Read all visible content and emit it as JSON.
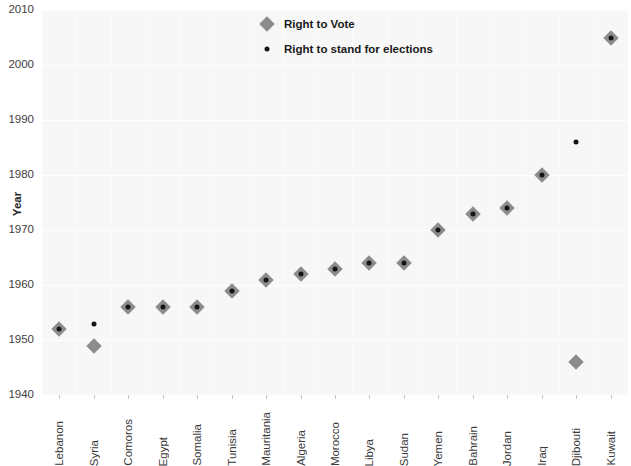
{
  "chart_data": {
    "type": "scatter",
    "title": "",
    "xlabel": "",
    "ylabel": "Year",
    "ylim": [
      1940,
      2010
    ],
    "yticks": [
      1940,
      1950,
      1960,
      1970,
      1980,
      1990,
      2000,
      2010
    ],
    "grid": true,
    "legend_position": "top-center",
    "categories": [
      "Lebanon",
      "Syria",
      "Comoros",
      "Egypt",
      "Somalia",
      "Tunisia",
      "Mauritania",
      "Algeria",
      "Morocco",
      "Libya",
      "Sudan",
      "Yemen",
      "Bahrain",
      "Jordan",
      "Iraq",
      "Djibouti",
      "Kuwait"
    ],
    "series": [
      {
        "name": "Right to Vote",
        "marker": "diamond",
        "color": "#8c8c8c",
        "values": [
          1952,
          1949,
          1956,
          1956,
          1956,
          1959,
          1961,
          1962,
          1963,
          1964,
          1964,
          1970,
          1973,
          1974,
          1980,
          1946,
          2005
        ]
      },
      {
        "name": "Right to stand for elections",
        "marker": "dot",
        "color": "#141414",
        "values": [
          1952,
          1953,
          1956,
          1956,
          1956,
          1959,
          1961,
          1962,
          1963,
          1964,
          1964,
          1970,
          1973,
          1974,
          1980,
          1986,
          2005
        ]
      }
    ]
  },
  "legend": {
    "items": [
      {
        "label": "Right to Vote",
        "marker": "diamond"
      },
      {
        "label": "Right to stand for elections",
        "marker": "dot"
      }
    ]
  },
  "axes": {
    "y_title": "Year"
  }
}
